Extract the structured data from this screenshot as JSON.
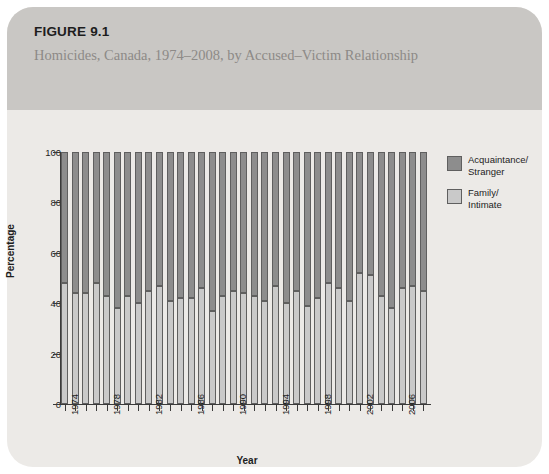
{
  "figure": {
    "number": "FIGURE 9.1",
    "title": "Homicides, Canada, 1974–2008, by Accused–Victim Relationship"
  },
  "colors": {
    "acquaintance_stranger": "#8d8d8d",
    "family_intimate": "#c9c9c9",
    "outline": "#5f5f5f",
    "banner": "#c9c7c4",
    "panel": "#eceae7"
  },
  "legend": {
    "position": "right",
    "items": [
      {
        "label": "Acquaintance/\nStranger",
        "line1": "Acquaintance/",
        "line2": "Stranger",
        "color": "#8d8d8d"
      },
      {
        "label": "Family/\nIntimate",
        "line1": "Family/",
        "line2": "Intimate",
        "color": "#c9c9c9"
      }
    ]
  },
  "chart_data": {
    "type": "bar",
    "stacked": true,
    "normalized_percent": true,
    "title": "Homicides, Canada, 1974–2008, by Accused–Victim Relationship",
    "xlabel": "Year",
    "ylabel": "Percentage",
    "ylim": [
      0,
      100
    ],
    "yticks": [
      0,
      20,
      40,
      60,
      80,
      100
    ],
    "ytick_labels": [
      "0",
      "20",
      "40",
      "60",
      "80",
      "100"
    ],
    "grid": false,
    "legend_position": "right",
    "categories": [
      "1974",
      "1975",
      "1976",
      "1977",
      "1978",
      "1979",
      "1980",
      "1981",
      "1982",
      "1983",
      "1984",
      "1985",
      "1986",
      "1987",
      "1988",
      "1989",
      "1990",
      "1991",
      "1992",
      "1993",
      "1994",
      "1995",
      "1996",
      "1997",
      "1998",
      "1999",
      "2000",
      "2001",
      "2002",
      "2003",
      "2004",
      "2005",
      "2006",
      "2007",
      "2008"
    ],
    "xtick_labels": [
      "1974",
      "1978",
      "1982",
      "1986",
      "1990",
      "1994",
      "1998",
      "2002",
      "2006"
    ],
    "series": [
      {
        "name": "Family/Intimate",
        "color": "#c9c9c9",
        "values": [
          48,
          44,
          44,
          48,
          43,
          38,
          43,
          40,
          45,
          47,
          41,
          42,
          42,
          46,
          37,
          43,
          45,
          44,
          43,
          41,
          47,
          40,
          45,
          39,
          42,
          48,
          46,
          41,
          52,
          51,
          43,
          38,
          46,
          47,
          45
        ]
      },
      {
        "name": "Acquaintance/Stranger",
        "color": "#8d8d8d",
        "values": [
          52,
          56,
          56,
          52,
          57,
          62,
          57,
          60,
          55,
          53,
          59,
          58,
          58,
          54,
          63,
          57,
          55,
          56,
          57,
          59,
          53,
          60,
          55,
          61,
          58,
          52,
          54,
          59,
          48,
          49,
          57,
          62,
          54,
          53,
          55
        ]
      }
    ]
  }
}
